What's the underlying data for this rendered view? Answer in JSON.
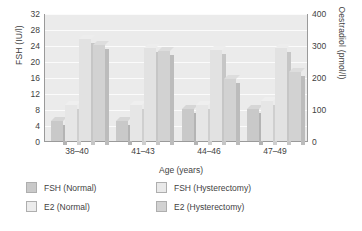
{
  "chart_data": {
    "type": "bar",
    "title": "",
    "xlabel": "Age (years)",
    "ylabel": "FSH (IU/l)",
    "y2label": "Oestradiol (pmol/l)",
    "categories": [
      "38–40",
      "41–43",
      "44–46",
      "47–49"
    ],
    "ylim": [
      0,
      32
    ],
    "y2lim": [
      0,
      400
    ],
    "yticks": [
      "0",
      "4",
      "8",
      "12",
      "16",
      "20",
      "24",
      "28",
      "32"
    ],
    "y2ticks": [
      "0",
      "100",
      "200",
      "300",
      "400"
    ],
    "grid": true,
    "legend_position": "below",
    "series": [
      {
        "name": "FSH (Normal)",
        "axis": "left",
        "unit": "IU/l",
        "values": [
          5,
          5,
          8,
          8
        ]
      },
      {
        "name": "FSH (Hysterectomy)",
        "axis": "left",
        "unit": "IU/l",
        "values": [
          9,
          9,
          9,
          10
        ]
      },
      {
        "name": "E2 (Normal)",
        "axis": "right",
        "unit": "pmol/l",
        "values": [
          320,
          290,
          285,
          290
        ]
      },
      {
        "name": "E2 (Hysterectomy)",
        "axis": "right",
        "unit": "pmol/l",
        "values": [
          300,
          280,
          195,
          215
        ]
      }
    ]
  },
  "axes": {
    "left_title": "FSH (IU/l)",
    "right_title": "Oestradiol (pmol/l)",
    "bottom_title": "Age (years)"
  },
  "legend": {
    "items": [
      {
        "label": "FSH (Normal)",
        "swatch": "sw0"
      },
      {
        "label": "FSH (Hysterectomy)",
        "swatch": "sw1"
      },
      {
        "label": "E2 (Normal)",
        "swatch": "sw2"
      },
      {
        "label": "E2 (Hysterectomy)",
        "swatch": "sw3"
      }
    ]
  },
  "colors": {
    "plot_background": "#ebebeb",
    "gridline": "#fbfbfb",
    "axis_line": "#9a9a9a",
    "text": "#3f3f3f",
    "fsh_normal": "#c9c9c9",
    "fsh_hysterectomy": "#e6e6e6",
    "e2_normal": "#e2e2e2",
    "e2_hysterectomy": "#d2d2d2"
  }
}
